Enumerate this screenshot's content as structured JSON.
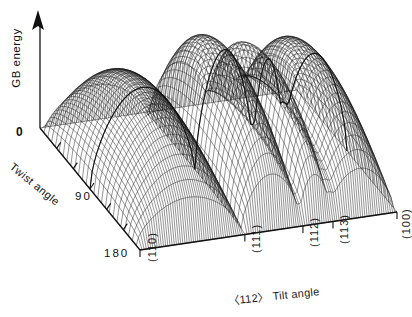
{
  "figure": {
    "background": "#ffffff",
    "line_color": "#111111"
  },
  "axes": {
    "vertical": {
      "label": "GB energy",
      "origin_label": "0",
      "has_arrow": true,
      "arrow_icon": "up-arrow-icon"
    },
    "depth": {
      "label": "Twist angle",
      "tick_labels": [
        "90",
        "180"
      ],
      "range": [
        0,
        180
      ],
      "units": "degrees",
      "tick_count": 5
    },
    "horizontal": {
      "label": "〈112〉 Tilt angle",
      "tick_labels": [
        "(110)",
        "(111)",
        "(112)",
        "(113)",
        "(100)"
      ]
    }
  },
  "chart_data": {
    "type": "surface",
    "title": "",
    "xlabel": "〈112〉 Tilt angle",
    "ylabel": "Twist angle",
    "zlabel": "GB energy",
    "x_tick_labels": [
      "(110)",
      "(111)",
      "(112)",
      "(113)",
      "(100)"
    ],
    "x_tick_fracs": [
      0.0,
      0.408,
      0.634,
      0.751,
      1.0
    ],
    "y_tick_labels": [
      "0",
      "90",
      "180"
    ],
    "ylim": [
      0,
      180
    ],
    "grid": false,
    "legend": null,
    "cusp_positions": [
      0.0,
      0.408,
      0.634,
      0.751,
      1.0
    ],
    "cusp_depths": [
      0.0,
      0.0,
      0.34,
      0.5,
      0.0
    ],
    "ridge_peaks": [
      {
        "x": 0.2,
        "z": 0.82
      },
      {
        "x": 0.52,
        "z": 1.0
      },
      {
        "x": 0.7,
        "z": 0.8
      },
      {
        "x": 0.87,
        "z": 0.83
      }
    ],
    "mesh": {
      "nx": 120,
      "ny": 26
    },
    "twist_profile": "energy rises from zero at 0 degrees twist to a broad maximum and falls back toward zero at 180 degrees"
  }
}
